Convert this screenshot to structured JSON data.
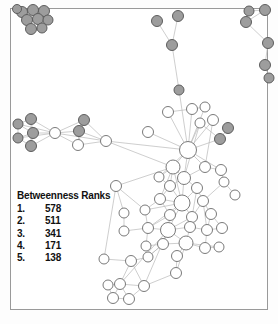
{
  "figure": {
    "type": "network-graph",
    "frame_color": "#9a9a9a",
    "background": "#ffffff"
  },
  "legend": {
    "title": "Betweenness Ranks",
    "rows": [
      {
        "rank": "1.",
        "value": "578"
      },
      {
        "rank": "2.",
        "value": "511"
      },
      {
        "rank": "3.",
        "value": "341"
      },
      {
        "rank": "4.",
        "value": "171"
      },
      {
        "rank": "5.",
        "value": "138"
      }
    ]
  },
  "chart_data": {
    "type": "scatter",
    "title": "Betweenness Ranks",
    "xlabel": "",
    "ylabel": "",
    "legend_position": "inside-left",
    "grid": false,
    "node_styles": {
      "gray": {
        "fill": "#9d9d9d",
        "stroke": "#5d5d5d"
      },
      "white": {
        "fill": "#ffffff",
        "stroke": "#7a7a7a"
      }
    },
    "edge_style": {
      "stroke": "#b9b9b9",
      "width": 0.7
    },
    "top_betweenness_values": [
      578,
      511,
      341,
      171,
      138
    ],
    "nodes": [
      {
        "id": 0,
        "x": 22,
        "y": 12,
        "r": 5.5,
        "c": "gray"
      },
      {
        "id": 1,
        "x": 33,
        "y": 10,
        "r": 5.5,
        "c": "gray"
      },
      {
        "id": 2,
        "x": 44,
        "y": 11,
        "r": 5.5,
        "c": "gray"
      },
      {
        "id": 3,
        "x": 27,
        "y": 20,
        "r": 5.5,
        "c": "gray"
      },
      {
        "id": 4,
        "x": 38,
        "y": 19,
        "r": 5.5,
        "c": "gray"
      },
      {
        "id": 5,
        "x": 48,
        "y": 20,
        "r": 5.0,
        "c": "gray"
      },
      {
        "id": 6,
        "x": 31,
        "y": 29,
        "r": 5.5,
        "c": "gray"
      },
      {
        "id": 7,
        "x": 42,
        "y": 28,
        "r": 5.0,
        "c": "gray"
      },
      {
        "id": 8,
        "x": 17,
        "y": 9,
        "r": 4.5,
        "c": "gray"
      },
      {
        "id": 9,
        "x": 157,
        "y": 21,
        "r": 5.5,
        "c": "gray"
      },
      {
        "id": 10,
        "x": 178,
        "y": 16,
        "r": 5.5,
        "c": "gray"
      },
      {
        "id": 11,
        "x": 172,
        "y": 45,
        "r": 5.5,
        "c": "gray"
      },
      {
        "id": 12,
        "x": 179,
        "y": 90,
        "r": 5.0,
        "c": "gray"
      },
      {
        "id": 13,
        "x": 249,
        "y": 11,
        "r": 5.0,
        "c": "gray"
      },
      {
        "id": 14,
        "x": 265,
        "y": 10,
        "r": 5.5,
        "c": "gray"
      },
      {
        "id": 15,
        "x": 246,
        "y": 22,
        "r": 5.5,
        "c": "gray"
      },
      {
        "id": 16,
        "x": 268,
        "y": 43,
        "r": 5.5,
        "c": "gray"
      },
      {
        "id": 17,
        "x": 265,
        "y": 65,
        "r": 5.5,
        "c": "gray"
      },
      {
        "id": 18,
        "x": 269,
        "y": 78,
        "r": 5.0,
        "c": "gray"
      },
      {
        "id": 19,
        "x": 18,
        "y": 124,
        "r": 5.0,
        "c": "gray"
      },
      {
        "id": 20,
        "x": 31,
        "y": 119,
        "r": 5.5,
        "c": "gray"
      },
      {
        "id": 21,
        "x": 18,
        "y": 138,
        "r": 5.0,
        "c": "gray"
      },
      {
        "id": 22,
        "x": 33,
        "y": 133,
        "r": 5.5,
        "c": "gray"
      },
      {
        "id": 23,
        "x": 31,
        "y": 146,
        "r": 5.5,
        "c": "gray"
      },
      {
        "id": 24,
        "x": 55,
        "y": 133,
        "r": 5.5,
        "c": "white"
      },
      {
        "id": 25,
        "x": 84,
        "y": 120,
        "r": 5.5,
        "c": "gray"
      },
      {
        "id": 26,
        "x": 79,
        "y": 131,
        "r": 5.5,
        "c": "gray"
      },
      {
        "id": 27,
        "x": 78,
        "y": 145,
        "r": 5.5,
        "c": "white"
      },
      {
        "id": 28,
        "x": 106,
        "y": 141,
        "r": 5.5,
        "c": "white"
      },
      {
        "id": 29,
        "x": 228,
        "y": 128,
        "r": 5.5,
        "c": "gray"
      },
      {
        "id": 30,
        "x": 220,
        "y": 139,
        "r": 5.5,
        "c": "gray"
      },
      {
        "id": 31,
        "x": 168,
        "y": 112,
        "r": 5.5,
        "c": "white"
      },
      {
        "id": 32,
        "x": 192,
        "y": 109,
        "r": 5.5,
        "c": "white"
      },
      {
        "id": 33,
        "x": 205,
        "y": 107,
        "r": 5.0,
        "c": "white"
      },
      {
        "id": 34,
        "x": 213,
        "y": 120,
        "r": 5.5,
        "c": "white"
      },
      {
        "id": 35,
        "x": 200,
        "y": 123,
        "r": 5.0,
        "c": "white"
      },
      {
        "id": 36,
        "x": 148,
        "y": 132,
        "r": 5.5,
        "c": "white"
      },
      {
        "id": 37,
        "x": 188,
        "y": 150,
        "r": 8.5,
        "c": "white"
      },
      {
        "id": 38,
        "x": 173,
        "y": 167,
        "r": 7.0,
        "c": "white"
      },
      {
        "id": 39,
        "x": 205,
        "y": 167,
        "r": 5.5,
        "c": "white"
      },
      {
        "id": 40,
        "x": 221,
        "y": 170,
        "r": 5.5,
        "c": "white"
      },
      {
        "id": 41,
        "x": 224,
        "y": 182,
        "r": 5.0,
        "c": "white"
      },
      {
        "id": 42,
        "x": 159,
        "y": 177,
        "r": 5.0,
        "c": "white"
      },
      {
        "id": 43,
        "x": 184,
        "y": 178,
        "r": 6.5,
        "c": "white"
      },
      {
        "id": 44,
        "x": 170,
        "y": 186,
        "r": 5.5,
        "c": "white"
      },
      {
        "id": 45,
        "x": 197,
        "y": 188,
        "r": 5.5,
        "c": "white"
      },
      {
        "id": 46,
        "x": 116,
        "y": 186,
        "r": 5.5,
        "c": "white"
      },
      {
        "id": 47,
        "x": 160,
        "y": 199,
        "r": 5.5,
        "c": "white"
      },
      {
        "id": 48,
        "x": 182,
        "y": 203,
        "r": 8.0,
        "c": "white"
      },
      {
        "id": 49,
        "x": 203,
        "y": 201,
        "r": 5.5,
        "c": "white"
      },
      {
        "id": 50,
        "x": 124,
        "y": 213,
        "r": 5.0,
        "c": "white"
      },
      {
        "id": 51,
        "x": 145,
        "y": 210,
        "r": 5.0,
        "c": "white"
      },
      {
        "id": 52,
        "x": 170,
        "y": 215,
        "r": 5.5,
        "c": "white"
      },
      {
        "id": 53,
        "x": 192,
        "y": 217,
        "r": 5.5,
        "c": "white"
      },
      {
        "id": 54,
        "x": 211,
        "y": 214,
        "r": 5.5,
        "c": "white"
      },
      {
        "id": 55,
        "x": 124,
        "y": 231,
        "r": 5.0,
        "c": "white"
      },
      {
        "id": 56,
        "x": 148,
        "y": 228,
        "r": 5.5,
        "c": "white"
      },
      {
        "id": 57,
        "x": 168,
        "y": 230,
        "r": 7.5,
        "c": "white"
      },
      {
        "id": 58,
        "x": 190,
        "y": 227,
        "r": 5.5,
        "c": "white"
      },
      {
        "id": 59,
        "x": 207,
        "y": 230,
        "r": 5.5,
        "c": "white"
      },
      {
        "id": 60,
        "x": 222,
        "y": 228,
        "r": 5.5,
        "c": "white"
      },
      {
        "id": 61,
        "x": 146,
        "y": 246,
        "r": 5.0,
        "c": "white"
      },
      {
        "id": 62,
        "x": 163,
        "y": 244,
        "r": 5.5,
        "c": "white"
      },
      {
        "id": 63,
        "x": 186,
        "y": 243,
        "r": 7.0,
        "c": "white"
      },
      {
        "id": 64,
        "x": 205,
        "y": 248,
        "r": 5.5,
        "c": "white"
      },
      {
        "id": 65,
        "x": 177,
        "y": 256,
        "r": 5.5,
        "c": "white"
      },
      {
        "id": 66,
        "x": 104,
        "y": 259,
        "r": 5.0,
        "c": "white"
      },
      {
        "id": 67,
        "x": 131,
        "y": 261,
        "r": 5.5,
        "c": "white"
      },
      {
        "id": 68,
        "x": 148,
        "y": 257,
        "r": 5.0,
        "c": "white"
      },
      {
        "id": 69,
        "x": 176,
        "y": 273,
        "r": 5.5,
        "c": "white"
      },
      {
        "id": 70,
        "x": 108,
        "y": 285,
        "r": 5.0,
        "c": "white"
      },
      {
        "id": 71,
        "x": 120,
        "y": 284,
        "r": 5.5,
        "c": "white"
      },
      {
        "id": 72,
        "x": 144,
        "y": 286,
        "r": 5.5,
        "c": "white"
      },
      {
        "id": 73,
        "x": 113,
        "y": 298,
        "r": 5.5,
        "c": "white"
      },
      {
        "id": 74,
        "x": 129,
        "y": 299,
        "r": 5.5,
        "c": "white"
      },
      {
        "id": 75,
        "x": 235,
        "y": 195,
        "r": 5.0,
        "c": "white"
      },
      {
        "id": 76,
        "x": 219,
        "y": 247,
        "r": 5.0,
        "c": "white"
      }
    ],
    "edges": [
      [
        8,
        0
      ],
      [
        0,
        1
      ],
      [
        1,
        2
      ],
      [
        0,
        3
      ],
      [
        1,
        3
      ],
      [
        1,
        4
      ],
      [
        2,
        4
      ],
      [
        2,
        5
      ],
      [
        3,
        4
      ],
      [
        4,
        5
      ],
      [
        3,
        6
      ],
      [
        4,
        6
      ],
      [
        4,
        7
      ],
      [
        5,
        7
      ],
      [
        6,
        7
      ],
      [
        9,
        11
      ],
      [
        10,
        11
      ],
      [
        11,
        12
      ],
      [
        12,
        37
      ],
      [
        13,
        15
      ],
      [
        14,
        15
      ],
      [
        15,
        16
      ],
      [
        16,
        17
      ],
      [
        17,
        18
      ],
      [
        13,
        14
      ],
      [
        19,
        20
      ],
      [
        19,
        21
      ],
      [
        20,
        22
      ],
      [
        21,
        22
      ],
      [
        22,
        23
      ],
      [
        19,
        22
      ],
      [
        21,
        23
      ],
      [
        20,
        23
      ],
      [
        20,
        24
      ],
      [
        22,
        24
      ],
      [
        23,
        24
      ],
      [
        19,
        24
      ],
      [
        21,
        24
      ],
      [
        24,
        25
      ],
      [
        24,
        26
      ],
      [
        24,
        27
      ],
      [
        25,
        26
      ],
      [
        26,
        27
      ],
      [
        25,
        27
      ],
      [
        26,
        28
      ],
      [
        27,
        28
      ],
      [
        25,
        28
      ],
      [
        24,
        28
      ],
      [
        28,
        37
      ],
      [
        28,
        38
      ],
      [
        31,
        37
      ],
      [
        32,
        37
      ],
      [
        33,
        37
      ],
      [
        34,
        37
      ],
      [
        35,
        37
      ],
      [
        36,
        37
      ],
      [
        30,
        37
      ],
      [
        29,
        30
      ],
      [
        30,
        35
      ],
      [
        37,
        38
      ],
      [
        37,
        43
      ],
      [
        37,
        39
      ],
      [
        37,
        40
      ],
      [
        37,
        42
      ],
      [
        38,
        43
      ],
      [
        38,
        42
      ],
      [
        38,
        44
      ],
      [
        38,
        47
      ],
      [
        38,
        48
      ],
      [
        39,
        40
      ],
      [
        40,
        41
      ],
      [
        39,
        43
      ],
      [
        41,
        49
      ],
      [
        42,
        44
      ],
      [
        43,
        44
      ],
      [
        43,
        45
      ],
      [
        43,
        48
      ],
      [
        44,
        47
      ],
      [
        44,
        48
      ],
      [
        45,
        48
      ],
      [
        45,
        49
      ],
      [
        45,
        53
      ],
      [
        46,
        50
      ],
      [
        46,
        51
      ],
      [
        46,
        38
      ],
      [
        47,
        48
      ],
      [
        47,
        51
      ],
      [
        47,
        52
      ],
      [
        48,
        52
      ],
      [
        48,
        53
      ],
      [
        48,
        56
      ],
      [
        48,
        57
      ],
      [
        48,
        51
      ],
      [
        49,
        53
      ],
      [
        49,
        54
      ],
      [
        49,
        59
      ],
      [
        50,
        55
      ],
      [
        51,
        56
      ],
      [
        52,
        57
      ],
      [
        52,
        56
      ],
      [
        53,
        57
      ],
      [
        53,
        58
      ],
      [
        54,
        59
      ],
      [
        54,
        60
      ],
      [
        55,
        56
      ],
      [
        56,
        57
      ],
      [
        56,
        61
      ],
      [
        57,
        58
      ],
      [
        57,
        62
      ],
      [
        57,
        63
      ],
      [
        58,
        59
      ],
      [
        58,
        63
      ],
      [
        59,
        60
      ],
      [
        59,
        64
      ],
      [
        61,
        62
      ],
      [
        62,
        63
      ],
      [
        62,
        68
      ],
      [
        63,
        64
      ],
      [
        63,
        65
      ],
      [
        63,
        69
      ],
      [
        64,
        76
      ],
      [
        65,
        69
      ],
      [
        66,
        67
      ],
      [
        67,
        68
      ],
      [
        67,
        72
      ],
      [
        68,
        62
      ],
      [
        66,
        46
      ],
      [
        67,
        71
      ],
      [
        69,
        72
      ],
      [
        70,
        71
      ],
      [
        71,
        72
      ],
      [
        70,
        73
      ],
      [
        71,
        73
      ],
      [
        71,
        74
      ],
      [
        73,
        74
      ],
      [
        72,
        74
      ],
      [
        72,
        57
      ],
      [
        71,
        57
      ],
      [
        75,
        41
      ],
      [
        76,
        63
      ],
      [
        35,
        43
      ],
      [
        34,
        39
      ],
      [
        33,
        32
      ],
      [
        32,
        31
      ]
    ]
  }
}
